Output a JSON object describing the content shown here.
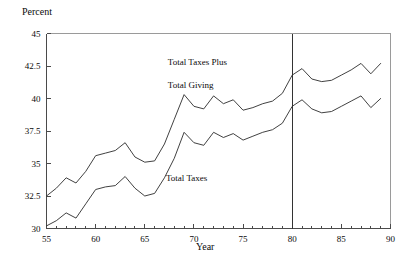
{
  "axis_titles": {
    "y": "Percent",
    "x": "Year"
  },
  "annotations": {
    "upper_line1": "Total Taxes Plus",
    "upper_line2": "Total Giving",
    "lower": "Total Taxes"
  },
  "colors": {
    "series": "#2b2b2b",
    "axis": "#4a4a4a",
    "frame": "#9a9a9a",
    "reference_line": "#333333",
    "background": "#ffffff",
    "text": "#0a0a0a"
  },
  "chart_data": {
    "type": "line",
    "title": "",
    "subtitle": "",
    "xlabel": "Year",
    "ylabel": "Percent",
    "xlim": [
      55,
      90
    ],
    "ylim": [
      30,
      45
    ],
    "grid": false,
    "legend": "inline-annotations",
    "x_tick_labels": [
      "55",
      "60",
      "65",
      "70",
      "75",
      "80",
      "85",
      "90"
    ],
    "x_major_ticks": [
      55,
      60,
      65,
      70,
      75,
      80,
      85,
      90
    ],
    "x_minor_tick_step": 1,
    "y_tick_labels": [
      "30",
      "32.5",
      "35",
      "37.5",
      "40",
      "42.5",
      "45"
    ],
    "y_ticks": [
      30,
      32.5,
      35,
      37.5,
      40,
      42.5,
      45
    ],
    "reference_lines": [
      {
        "axis": "x",
        "value": 80
      }
    ],
    "x": [
      55,
      56,
      57,
      58,
      59,
      60,
      61,
      62,
      63,
      64,
      65,
      66,
      67,
      68,
      69,
      70,
      71,
      72,
      73,
      74,
      75,
      76,
      77,
      78,
      79,
      80,
      81,
      82,
      83,
      84,
      85,
      86,
      87,
      88,
      89
    ],
    "series": [
      {
        "name": "Total Taxes Plus Total Giving",
        "values": [
          32.5,
          33.1,
          33.9,
          33.5,
          34.4,
          35.6,
          35.8,
          36.0,
          36.6,
          35.5,
          35.1,
          35.2,
          36.5,
          38.4,
          40.3,
          39.4,
          39.2,
          40.2,
          39.6,
          39.9,
          39.1,
          39.3,
          39.6,
          39.8,
          40.4,
          41.8,
          42.3,
          41.5,
          41.3,
          41.4,
          41.8,
          42.2,
          42.7,
          41.9,
          42.7
        ]
      },
      {
        "name": "Total Taxes",
        "values": [
          30.2,
          30.6,
          31.2,
          30.8,
          31.9,
          33.0,
          33.2,
          33.3,
          34.0,
          33.1,
          32.5,
          32.7,
          33.9,
          35.4,
          37.4,
          36.6,
          36.4,
          37.4,
          37.0,
          37.3,
          36.8,
          37.1,
          37.4,
          37.6,
          38.1,
          39.4,
          39.9,
          39.2,
          38.9,
          39.0,
          39.4,
          39.8,
          40.2,
          39.3,
          40.0
        ]
      }
    ]
  }
}
